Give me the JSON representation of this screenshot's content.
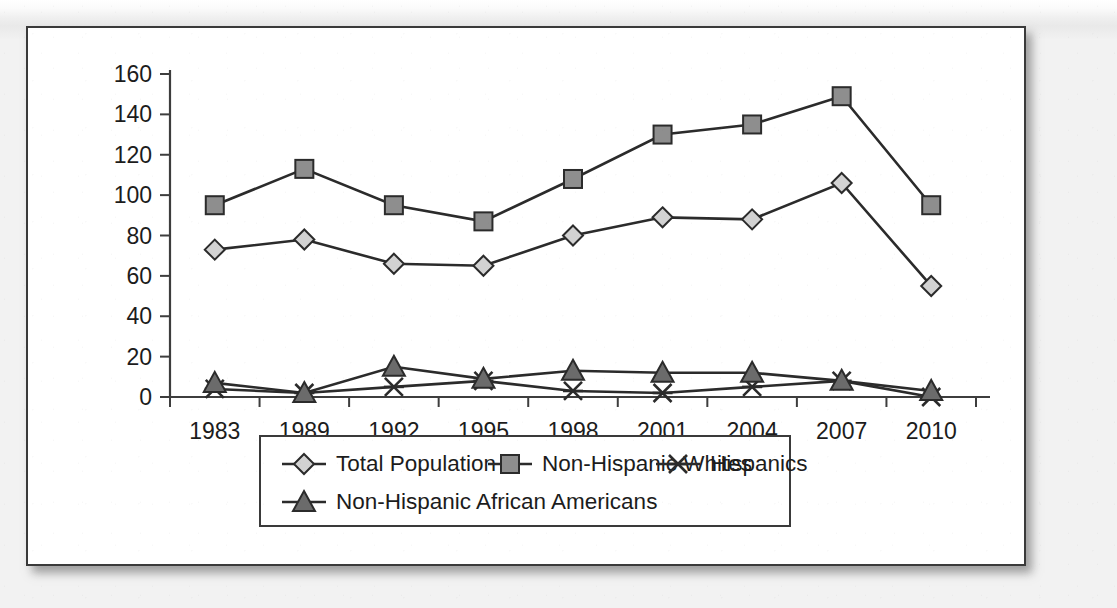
{
  "chart_data": {
    "type": "line",
    "title": "",
    "xlabel": "",
    "ylabel": "",
    "categories": [
      "1983",
      "1989",
      "1992",
      "1995",
      "1998",
      "2001",
      "2004",
      "2007",
      "2010"
    ],
    "ylim": [
      0,
      160
    ],
    "yticks": [
      "0",
      "20",
      "40",
      "60",
      "80",
      "100",
      "120",
      "140",
      "160"
    ],
    "ytick_values": [
      0,
      20,
      40,
      60,
      80,
      100,
      120,
      140,
      160
    ],
    "grid": false,
    "legend_position": "bottom",
    "series": [
      {
        "name": "Total Population",
        "marker": "diamond",
        "color": "#d2d2d2",
        "values": [
          73,
          78,
          66,
          65,
          80,
          89,
          88,
          106,
          55
        ]
      },
      {
        "name": "Non-Hispanic Whites",
        "marker": "square",
        "color": "#8e8e8e",
        "values": [
          95,
          113,
          95,
          87,
          108,
          130,
          135,
          149,
          95
        ]
      },
      {
        "name": "Hispanics",
        "marker": "x",
        "color": "#2b2b2b",
        "values": [
          4,
          2,
          5,
          8,
          3,
          2,
          5,
          8,
          0
        ]
      },
      {
        "name": "Non-Hispanic African Americans",
        "marker": "triangle",
        "color": "#6b6b6b",
        "values": [
          7,
          2,
          15,
          9,
          13,
          12,
          12,
          8,
          3
        ]
      }
    ]
  },
  "legend": {
    "rows": [
      [
        "Total Population",
        "Non-Hispanic Whites",
        "Hispanics"
      ],
      [
        "Non-Hispanic African Americans"
      ]
    ]
  },
  "colors": {
    "axis": "#3d3d3d",
    "line": "#2b2b2b",
    "card_border": "#3a3a3a",
    "card_background": "#ffffff",
    "page_background": "#efefef"
  }
}
